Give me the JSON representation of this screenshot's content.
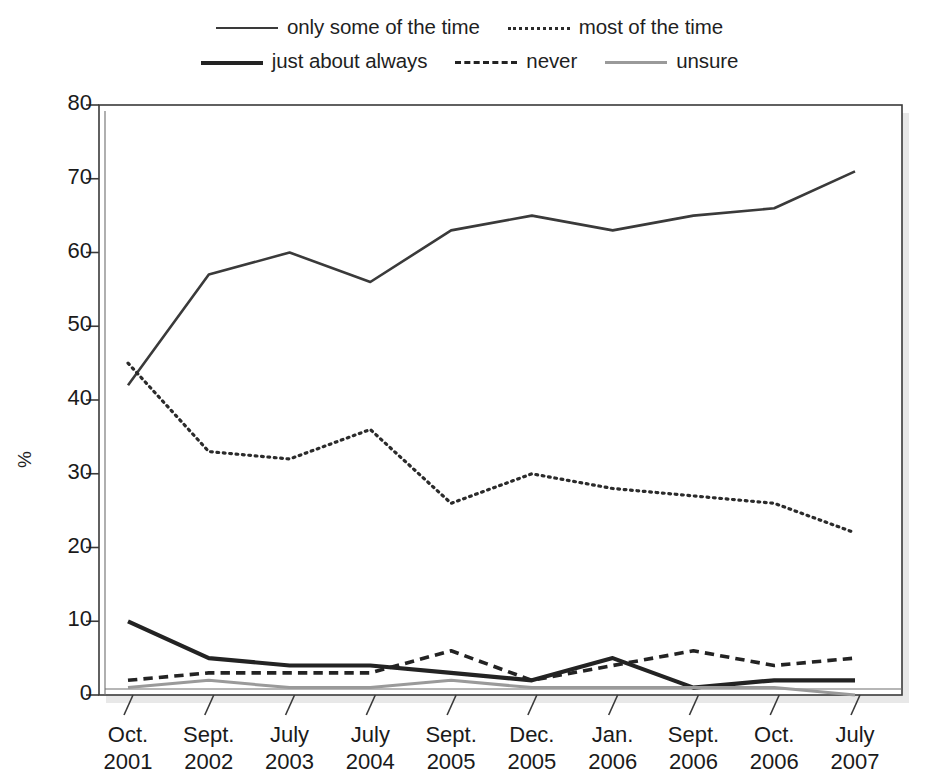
{
  "chart_data": {
    "type": "line",
    "title": "",
    "subtitle": "",
    "xlabel": "",
    "ylabel": "%",
    "ylim": [
      0,
      80
    ],
    "ytick_step": 10,
    "yticks": [
      0,
      10,
      20,
      30,
      40,
      50,
      60,
      70,
      80
    ],
    "grid": false,
    "legend_position": "top-center",
    "categories": [
      "Oct. 2001",
      "Sept. 2002",
      "July 2003",
      "July 2004",
      "Sept. 2005",
      "Dec. 2005",
      "Jan. 2006",
      "Sept. 2006",
      "Oct. 2006",
      "July 2007"
    ],
    "category_lines": [
      [
        "Oct.",
        "2001"
      ],
      [
        "Sept.",
        "2002"
      ],
      [
        "July",
        "2003"
      ],
      [
        "July",
        "2004"
      ],
      [
        "Sept.",
        "2005"
      ],
      [
        "Dec.",
        "2005"
      ],
      [
        "Jan.",
        "2006"
      ],
      [
        "Sept.",
        "2006"
      ],
      [
        "Oct.",
        "2006"
      ],
      [
        "July",
        "2007"
      ]
    ],
    "series": [
      {
        "name": "only some of the time",
        "style": "solid",
        "width": 2.6,
        "color": "#3a3a3a",
        "values": [
          42,
          57,
          60,
          56,
          63,
          65,
          63,
          65,
          66,
          71
        ]
      },
      {
        "name": "most of the time",
        "style": "dotted",
        "width": 3.2,
        "color": "#2b2b2b",
        "values": [
          45,
          33,
          32,
          36,
          26,
          30,
          28,
          27,
          26,
          22
        ]
      },
      {
        "name": "just about always",
        "style": "solid",
        "width": 4.2,
        "color": "#232323",
        "values": [
          10,
          5,
          4,
          4,
          3,
          2,
          5,
          1,
          2,
          2
        ]
      },
      {
        "name": "never",
        "style": "dashed",
        "width": 3.6,
        "color": "#232323",
        "values": [
          2,
          3,
          3,
          3,
          6,
          2,
          4,
          6,
          4,
          5
        ]
      },
      {
        "name": "unsure",
        "style": "solid",
        "width": 3.0,
        "color": "#9a9a9a",
        "values": [
          1,
          2,
          1,
          1,
          2,
          1,
          1,
          1,
          1,
          0
        ]
      }
    ]
  },
  "legend": {
    "rows": [
      [
        {
          "label": "only some of the time",
          "swatch": "solid-thin"
        },
        {
          "label": "most of the time",
          "swatch": "dotted"
        }
      ],
      [
        {
          "label": "just about always",
          "swatch": "solid-thick"
        },
        {
          "label": "never",
          "swatch": "dashed"
        },
        {
          "label": "unsure",
          "swatch": "gray"
        }
      ]
    ]
  },
  "axis": {
    "y_axis_title": "%",
    "y_tick_labels": [
      "80",
      "70",
      "60",
      "50",
      "40",
      "30",
      "20",
      "10",
      "0"
    ]
  },
  "colors": {
    "line_dark": "#232323",
    "line_medium": "#3a3a3a",
    "line_gray": "#9a9a9a",
    "axis": "#3a3a3a",
    "background": "#ffffff"
  }
}
